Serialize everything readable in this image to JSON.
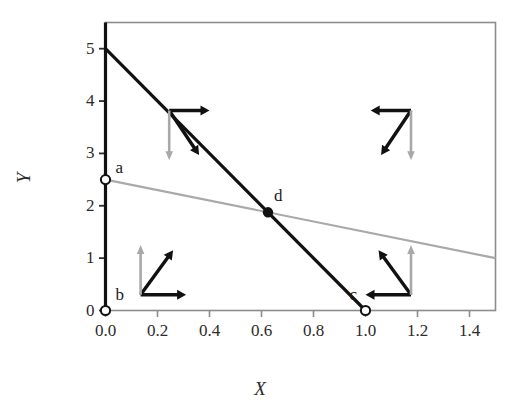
{
  "chart_data": {
    "type": "line",
    "title": "",
    "xlabel": "X",
    "ylabel": "Y",
    "xlim": [
      0.0,
      1.5
    ],
    "ylim": [
      0.0,
      5.5
    ],
    "xticks": [
      "0.0",
      "0.2",
      "0.4",
      "0.6",
      "0.8",
      "1.0",
      "1.2",
      "1.4"
    ],
    "xtick_values": [
      0.0,
      0.2,
      0.4,
      0.6,
      0.8,
      1.0,
      1.2,
      1.4
    ],
    "yticks": [
      "0",
      "1",
      "2",
      "3",
      "4",
      "5"
    ],
    "ytick_values": [
      0,
      1,
      2,
      3,
      4,
      5
    ],
    "grid": false,
    "legend": "none",
    "series": [
      {
        "name": "steep-black-line",
        "color": "#111111",
        "width": 3.2,
        "points": [
          [
            0.0,
            5.0
          ],
          [
            1.0,
            0.0
          ]
        ],
        "slope": -5.0,
        "intercept": 5.0
      },
      {
        "name": "shallow-gray-line",
        "color": "#a9a9a9",
        "width": 2.2,
        "points": [
          [
            0.0,
            2.5
          ],
          [
            1.5,
            1.0
          ]
        ],
        "slope": -1.0,
        "intercept": 2.5
      },
      {
        "name": "vertical-axis-line",
        "color": "#111111",
        "width": 3.2,
        "points": [
          [
            0.0,
            0.0
          ],
          [
            0.0,
            5.5
          ]
        ]
      }
    ],
    "points": [
      {
        "label": "a",
        "x": 0.0,
        "y": 2.5,
        "marker": "open-circle",
        "label_dx": 10,
        "label_dy": -22
      },
      {
        "label": "b",
        "x": 0.0,
        "y": 0.0,
        "marker": "open-circle",
        "label_dx": 10,
        "label_dy": -26
      },
      {
        "label": "c",
        "x": 1.0,
        "y": 0.0,
        "marker": "open-circle",
        "label_dx": -16,
        "label_dy": -26
      },
      {
        "label": "d",
        "x": 0.625,
        "y": 1.875,
        "marker": "filled-circle",
        "label_dx": 6,
        "label_dy": -26
      }
    ],
    "arrow_clusters": [
      {
        "name": "upper-left-cluster",
        "corner_x": 0.245,
        "corner_y": 3.82,
        "arrows": [
          {
            "name": "black-right-arrow",
            "dx": 0.155,
            "dy": 0.0,
            "color": "#111111"
          },
          {
            "name": "black-down-right-arrow",
            "dx": 0.115,
            "dy": -0.85,
            "color": "#111111"
          },
          {
            "name": "gray-down-arrow",
            "dx": 0.0,
            "dy": -0.95,
            "color": "#a9a9a9"
          }
        ]
      },
      {
        "name": "upper-right-cluster",
        "corner_x": 1.175,
        "corner_y": 3.82,
        "arrows": [
          {
            "name": "black-left-arrow",
            "dx": -0.155,
            "dy": 0.0,
            "color": "#111111"
          },
          {
            "name": "black-down-left-arrow",
            "dx": -0.115,
            "dy": -0.85,
            "color": "#111111"
          },
          {
            "name": "gray-down-arrow",
            "dx": 0.0,
            "dy": -0.95,
            "color": "#a9a9a9"
          }
        ]
      },
      {
        "name": "lower-left-cluster",
        "corner_x": 0.135,
        "corner_y": 0.3,
        "arrows": [
          {
            "name": "black-right-arrow",
            "dx": 0.175,
            "dy": 0.0,
            "color": "#111111"
          },
          {
            "name": "black-up-right-arrow",
            "dx": 0.125,
            "dy": 0.85,
            "color": "#111111"
          },
          {
            "name": "gray-up-arrow",
            "dx": 0.0,
            "dy": 0.95,
            "color": "#a9a9a9"
          }
        ]
      },
      {
        "name": "lower-right-cluster",
        "corner_x": 1.175,
        "corner_y": 0.3,
        "arrows": [
          {
            "name": "black-left-arrow",
            "dx": -0.175,
            "dy": 0.0,
            "color": "#111111"
          },
          {
            "name": "black-up-left-arrow",
            "dx": -0.125,
            "dy": 0.85,
            "color": "#111111"
          },
          {
            "name": "gray-up-arrow",
            "dx": 0.0,
            "dy": 0.95,
            "color": "#a9a9a9"
          }
        ]
      }
    ],
    "colors": {
      "frame": "#8c8c8c",
      "black_line": "#111111",
      "gray_line": "#a9a9a9",
      "text": "#2b2b2b",
      "background": "#ffffff"
    }
  }
}
